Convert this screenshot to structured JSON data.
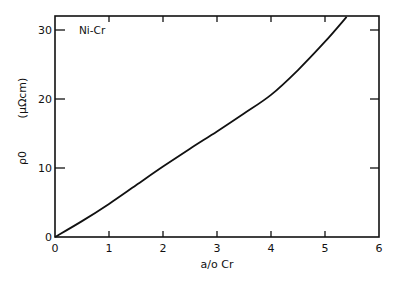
{
  "chart_data": {
    "type": "line",
    "title": "",
    "annotation": "Ni-Cr",
    "xlabel": "a/o Cr",
    "ylabel": "ρ0",
    "ylabel_units": "(μΩcm)",
    "xlim": [
      0,
      6
    ],
    "ylim": [
      0,
      32
    ],
    "x_ticks": [
      0,
      1,
      2,
      3,
      4,
      5,
      6
    ],
    "y_ticks": [
      0,
      10,
      20,
      30
    ],
    "grid": false,
    "legend": null,
    "series": [
      {
        "name": "Ni-Cr",
        "x": [
          0,
          0.5,
          1,
          1.5,
          2,
          2.5,
          3,
          3.5,
          4,
          4.5,
          5,
          5.4
        ],
        "values": [
          0,
          2.3,
          4.8,
          7.5,
          10.2,
          12.8,
          15.3,
          17.9,
          20.6,
          24.2,
          28.3,
          31.9
        ]
      }
    ]
  }
}
